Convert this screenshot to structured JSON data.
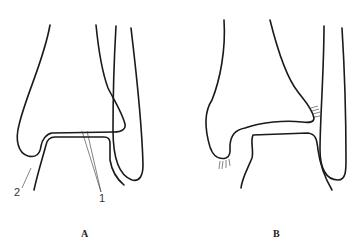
{
  "figure": {
    "panels": [
      {
        "id": "A",
        "caption": "A",
        "labels": [
          {
            "text": "2"
          },
          {
            "text": "1"
          }
        ]
      },
      {
        "id": "B",
        "caption": "B"
      }
    ]
  },
  "colors": {
    "line": "#1a1a1a",
    "background": "#ffffff"
  }
}
